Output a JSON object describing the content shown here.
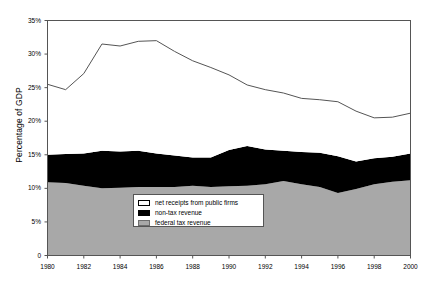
{
  "chart_data": {
    "type": "area",
    "title": "",
    "xlabel": "",
    "ylabel": "Percentage of GDP",
    "xlim": [
      1980,
      2000
    ],
    "ylim": [
      0,
      35
    ],
    "grid": false,
    "legend_position": "inside-bottom-center",
    "x": [
      1980,
      1981,
      1982,
      1983,
      1984,
      1985,
      1986,
      1987,
      1988,
      1989,
      1990,
      1991,
      1992,
      1993,
      1994,
      1995,
      1996,
      1997,
      1998,
      1999,
      2000
    ],
    "y_ticks": [
      0,
      5,
      10,
      15,
      20,
      25,
      30,
      35
    ],
    "y_tick_labels": [
      "0",
      "5%",
      "10%",
      "15%",
      "20%",
      "25%",
      "30%",
      "35%"
    ],
    "x_ticks": [
      1980,
      1982,
      1984,
      1986,
      1988,
      1990,
      1992,
      1994,
      1996,
      1998,
      2000
    ],
    "x_tick_labels": [
      "1980",
      "1982",
      "1984",
      "1986",
      "1988",
      "1990",
      "1992",
      "1994",
      "1996",
      "1998",
      "2000"
    ],
    "stacked": true,
    "series": [
      {
        "name": "federal tax revenue",
        "color": "#a8a8a8",
        "values": [
          10.9,
          10.8,
          10.4,
          10.0,
          10.1,
          10.2,
          10.2,
          10.2,
          10.4,
          10.2,
          10.3,
          10.4,
          10.6,
          11.1,
          10.6,
          10.2,
          9.3,
          9.9,
          10.6,
          11.0,
          11.2
        ]
      },
      {
        "name": "non-tax revenue",
        "color": "#000000",
        "values": [
          4.1,
          4.3,
          4.8,
          5.6,
          5.4,
          5.4,
          5.0,
          4.7,
          4.2,
          4.4,
          5.4,
          5.9,
          5.2,
          4.5,
          4.8,
          5.1,
          5.5,
          4.1,
          3.9,
          3.7,
          4.0
        ]
      },
      {
        "name": "net receipts from public firms",
        "color": "#ffffff",
        "values": [
          10.5,
          9.6,
          11.9,
          15.9,
          15.7,
          16.3,
          16.8,
          15.5,
          14.4,
          13.4,
          11.2,
          9.1,
          8.9,
          8.6,
          8.0,
          7.9,
          8.1,
          7.5,
          6.0,
          5.9,
          6.0
        ]
      }
    ],
    "total_line": {
      "name": "total revenue (upper boundary)",
      "color": "#555555",
      "values": [
        25.5,
        24.7,
        27.1,
        31.5,
        31.2,
        31.9,
        32.0,
        30.4,
        29.0,
        28.0,
        26.9,
        25.4,
        24.7,
        24.2,
        23.4,
        23.2,
        22.9,
        21.5,
        20.5,
        20.6,
        21.2
      ]
    }
  },
  "legend": {
    "items": [
      {
        "label": "net receipts from public firms",
        "swatch": "white-swatch-icon"
      },
      {
        "label": "non-tax revenue",
        "swatch": "black-swatch-icon"
      },
      {
        "label": "federal tax revenue",
        "swatch": "gray-swatch-icon"
      }
    ]
  },
  "colors": {
    "federal_tax_revenue": "#a8a8a8",
    "non_tax_revenue": "#000000",
    "net_receipts": "#ffffff",
    "axis": "#555555",
    "text": "#000000"
  }
}
